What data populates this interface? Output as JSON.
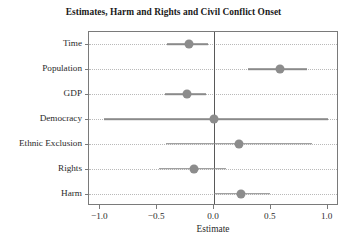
{
  "chart_data": {
    "type": "scatter",
    "title": "Estimates, Harm and Rights and Civil Conflict Onset",
    "xlabel": "Estimate",
    "ylabel": "",
    "xlim": [
      -1.1,
      1.1
    ],
    "xticks": [
      -1.0,
      -0.5,
      0.0,
      0.5,
      1.0
    ],
    "xticklabels": [
      "−1.0",
      "−0.5",
      "0.0",
      "0.5",
      "1.0"
    ],
    "grid": true,
    "grid_style": "dotted-horizontal",
    "legend": "none",
    "reference_line": 0.0,
    "point_color": "#8c8c8c",
    "line_color": "#8a8a8a",
    "categories": [
      "Time",
      "Population",
      "GDP",
      "Democracy",
      "Ethnic Exclusion",
      "Rights",
      "Harm"
    ],
    "values": [
      -0.22,
      0.58,
      -0.24,
      0.0,
      0.22,
      -0.18,
      0.24
    ],
    "ci_low": [
      -0.41,
      0.3,
      -0.43,
      -0.97,
      -0.42,
      -0.48,
      0.0
    ],
    "ci_high": [
      -0.05,
      0.82,
      -0.07,
      1.0,
      0.86,
      0.11,
      0.49
    ],
    "points": [
      {
        "label": "Time",
        "estimate": -0.22,
        "ci_low": -0.41,
        "ci_high": -0.05
      },
      {
        "label": "Population",
        "estimate": 0.58,
        "ci_low": 0.3,
        "ci_high": 0.82
      },
      {
        "label": "GDP",
        "estimate": -0.24,
        "ci_low": -0.43,
        "ci_high": -0.07
      },
      {
        "label": "Democracy",
        "estimate": 0.0,
        "ci_low": -0.97,
        "ci_high": 1.0
      },
      {
        "label": "Ethnic Exclusion",
        "estimate": 0.22,
        "ci_low": -0.42,
        "ci_high": 0.86
      },
      {
        "label": "Rights",
        "estimate": -0.18,
        "ci_low": -0.48,
        "ci_high": 0.11
      },
      {
        "label": "Harm",
        "estimate": 0.24,
        "ci_low": 0.0,
        "ci_high": 0.49
      }
    ]
  }
}
